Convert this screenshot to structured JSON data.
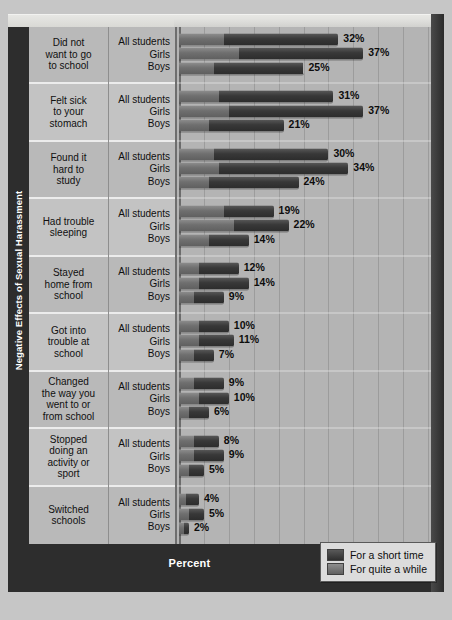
{
  "chart_data": {
    "type": "bar",
    "orientation": "horizontal",
    "stacked": true,
    "title": "",
    "xlabel": "Percent",
    "ylabel": "Negative Effects of Sexual Harassment",
    "xlim": [
      0,
      50
    ],
    "xticks": [
      "0",
      "5",
      "10",
      "15",
      "20",
      "25",
      "30",
      "35",
      "40",
      "45",
      "50"
    ],
    "grid": true,
    "legend_position": "bottom-right",
    "legend": [
      "For a short time",
      "For quite a while"
    ],
    "group_labels": [
      "All students",
      "Girls",
      "Boys"
    ],
    "categories": [
      "Did not want to go to school",
      "Felt sick to your stomach",
      "Found it hard to study",
      "Had trouble sleeping",
      "Stayed home from school",
      "Got into trouble at school",
      "Changed the way you went to or from school",
      "Stopped doing an activity or sport",
      "Switched schools"
    ],
    "groups": [
      {
        "label_lines": [
          "Did not",
          "want to go",
          "to school"
        ],
        "rows": [
          {
            "group": "All students",
            "total": 32,
            "total_label": "32%",
            "quite_a_while": 9,
            "short_time": 23
          },
          {
            "group": "Girls",
            "total": 37,
            "total_label": "37%",
            "quite_a_while": 12,
            "short_time": 25
          },
          {
            "group": "Boys",
            "total": 25,
            "total_label": "25%",
            "quite_a_while": 7,
            "short_time": 18
          }
        ]
      },
      {
        "label_lines": [
          "Felt sick",
          "to your",
          "stomach"
        ],
        "rows": [
          {
            "group": "All students",
            "total": 31,
            "total_label": "31%",
            "quite_a_while": 8,
            "short_time": 23
          },
          {
            "group": "Girls",
            "total": 37,
            "total_label": "37%",
            "quite_a_while": 10,
            "short_time": 27
          },
          {
            "group": "Boys",
            "total": 21,
            "total_label": "21%",
            "quite_a_while": 6,
            "short_time": 15
          }
        ]
      },
      {
        "label_lines": [
          "Found it",
          "hard to",
          "study"
        ],
        "rows": [
          {
            "group": "All students",
            "total": 30,
            "total_label": "30%",
            "quite_a_while": 7,
            "short_time": 23
          },
          {
            "group": "Girls",
            "total": 34,
            "total_label": "34%",
            "quite_a_while": 8,
            "short_time": 26
          },
          {
            "group": "Boys",
            "total": 24,
            "total_label": "24%",
            "quite_a_while": 6,
            "short_time": 18
          }
        ]
      },
      {
        "label_lines": [
          "Had trouble",
          "sleeping"
        ],
        "rows": [
          {
            "group": "All students",
            "total": 19,
            "total_label": "19%",
            "quite_a_while": 9,
            "short_time": 10
          },
          {
            "group": "Girls",
            "total": 22,
            "total_label": "22%",
            "quite_a_while": 11,
            "short_time": 11
          },
          {
            "group": "Boys",
            "total": 14,
            "total_label": "14%",
            "quite_a_while": 6,
            "short_time": 8
          }
        ]
      },
      {
        "label_lines": [
          "Stayed",
          "home from",
          "school"
        ],
        "rows": [
          {
            "group": "All students",
            "total": 12,
            "total_label": "12%",
            "quite_a_while": 4,
            "short_time": 8
          },
          {
            "group": "Girls",
            "total": 14,
            "total_label": "14%",
            "quite_a_while": 4,
            "short_time": 10
          },
          {
            "group": "Boys",
            "total": 9,
            "total_label": "9%",
            "quite_a_while": 3,
            "short_time": 6
          }
        ]
      },
      {
        "label_lines": [
          "Got into",
          "trouble at",
          "school"
        ],
        "rows": [
          {
            "group": "All students",
            "total": 10,
            "total_label": "10%",
            "quite_a_while": 4,
            "short_time": 6
          },
          {
            "group": "Girls",
            "total": 11,
            "total_label": "11%",
            "quite_a_while": 4,
            "short_time": 7
          },
          {
            "group": "Boys",
            "total": 7,
            "total_label": "7%",
            "quite_a_while": 3,
            "short_time": 4
          }
        ]
      },
      {
        "label_lines": [
          "Changed",
          "the way you",
          "went to or",
          "from school"
        ],
        "rows": [
          {
            "group": "All students",
            "total": 9,
            "total_label": "9%",
            "quite_a_while": 3,
            "short_time": 6
          },
          {
            "group": "Girls",
            "total": 10,
            "total_label": "10%",
            "quite_a_while": 4,
            "short_time": 6
          },
          {
            "group": "Boys",
            "total": 6,
            "total_label": "6%",
            "quite_a_while": 2,
            "short_time": 4
          }
        ]
      },
      {
        "label_lines": [
          "Stopped",
          "doing an",
          "activity or",
          "sport"
        ],
        "rows": [
          {
            "group": "All students",
            "total": 8,
            "total_label": "8%",
            "quite_a_while": 3,
            "short_time": 5
          },
          {
            "group": "Girls",
            "total": 9,
            "total_label": "9%",
            "quite_a_while": 3,
            "short_time": 6
          },
          {
            "group": "Boys",
            "total": 5,
            "total_label": "5%",
            "quite_a_while": 2,
            "short_time": 3
          }
        ]
      },
      {
        "label_lines": [
          "Switched",
          "schools"
        ],
        "rows": [
          {
            "group": "All students",
            "total": 4,
            "total_label": "4%",
            "quite_a_while": 1.5,
            "short_time": 2.5
          },
          {
            "group": "Girls",
            "total": 5,
            "total_label": "5%",
            "quite_a_while": 2,
            "short_time": 3
          },
          {
            "group": "Boys",
            "total": 2,
            "total_label": "2%",
            "quite_a_while": 1,
            "short_time": 1
          }
        ]
      }
    ]
  },
  "colors": {
    "short_time": "#383838",
    "quite_a_while": "#6f6f6f",
    "panel": "#b9b9b9",
    "frame_dark": "#2d2d2d"
  }
}
